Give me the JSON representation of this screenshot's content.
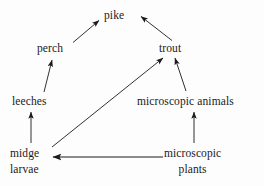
{
  "diagram": {
    "type": "food-web",
    "title": "",
    "background_color": "#fdfdfd",
    "stroke_color": "#1a1a1a",
    "nodes": [
      {
        "id": "pike",
        "label": "pike",
        "lines": [
          "pike"
        ]
      },
      {
        "id": "perch",
        "label": "perch",
        "lines": [
          "perch"
        ]
      },
      {
        "id": "trout",
        "label": "trout",
        "lines": [
          "trout"
        ]
      },
      {
        "id": "leeches",
        "label": "leeches",
        "lines": [
          "leeches"
        ]
      },
      {
        "id": "microscopic_animals",
        "label": "microscopic animals",
        "lines": [
          "microscopic animals"
        ]
      },
      {
        "id": "midge_larvae",
        "label": "midge larvae",
        "lines": [
          "midge",
          "larvae"
        ]
      },
      {
        "id": "microscopic_plants",
        "label": "microscopic plants",
        "lines": [
          "microscopic",
          "plants"
        ]
      }
    ],
    "edges": [
      {
        "from": "perch",
        "to": "pike",
        "direction": "up-right"
      },
      {
        "from": "trout",
        "to": "pike",
        "direction": "up-left"
      },
      {
        "from": "leeches",
        "to": "perch",
        "direction": "up"
      },
      {
        "from": "midge_larvae",
        "to": "trout",
        "direction": "up-right-long"
      },
      {
        "from": "microscopic_animals",
        "to": "trout",
        "direction": "up"
      },
      {
        "from": "midge_larvae",
        "to": "leeches",
        "direction": "up"
      },
      {
        "from": "microscopic_plants",
        "to": "microscopic_animals",
        "direction": "up"
      },
      {
        "from": "microscopic_plants",
        "to": "midge_larvae",
        "direction": "left"
      }
    ]
  },
  "labels": {
    "pike": "pike",
    "perch": "perch",
    "trout": "trout",
    "leeches": "leeches",
    "microscopic_animals": "microscopic animals",
    "midge_line1": "midge",
    "midge_line2": "larvae",
    "plants_line1": "microscopic",
    "plants_line2": "plants"
  }
}
